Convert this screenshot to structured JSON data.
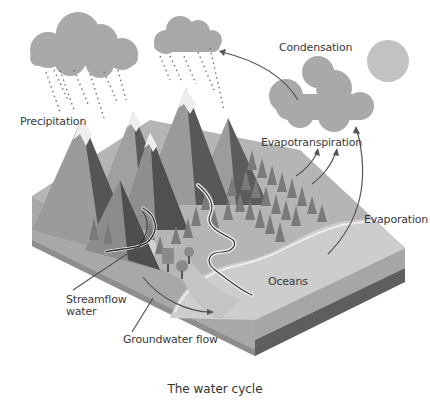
{
  "figure": {
    "caption": "The water cycle",
    "labels": {
      "precipitation": "Precipitation",
      "condensation": "Condensation",
      "evapotranspiration": "Evapotranspiration",
      "evaporation": "Evaporation",
      "oceans": "Oceans",
      "streamflow_line1": "Streamflow",
      "streamflow_line2": "water",
      "groundwater": "Groundwater flow"
    },
    "colors": {
      "background": "#ffffff",
      "cloud": "#a9a9a9",
      "sun": "#c2c2c2",
      "land_top": "#b5b5b5",
      "ocean_top": "#cdcdcd",
      "side_light": "#a6a6a6",
      "side_dark": "#5e5e5e",
      "mountain_light": "#9a9a9a",
      "mountain_dark": "#5a5a5a",
      "snow": "#eeeeee",
      "tree": "#7a7a7a",
      "arrow": "#555555"
    }
  }
}
